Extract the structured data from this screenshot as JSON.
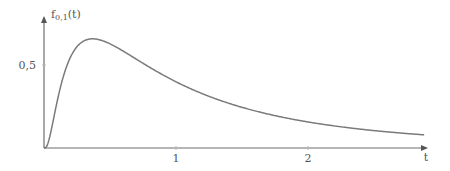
{
  "chart_data": {
    "type": "line",
    "title": "",
    "xlabel": "t",
    "ylabel": "f0,1(t)",
    "ylabel_main": "f",
    "ylabel_sub": "0,1",
    "ylabel_arg": "(t)",
    "x_ticks": [
      {
        "value": 1,
        "label": "1"
      },
      {
        "value": 2,
        "label": "2"
      }
    ],
    "y_ticks": [
      {
        "value": 0.5,
        "label": "0,5"
      }
    ],
    "xlim": [
      0,
      2.9
    ],
    "ylim": [
      0,
      0.8
    ],
    "grid": false,
    "legend": null,
    "series": [
      {
        "name": "f0,1(t) (log-normal density, mu=0, sigma=1)",
        "x": [
          0.0,
          0.05,
          0.1,
          0.15,
          0.2,
          0.25,
          0.3,
          0.37,
          0.45,
          0.5,
          0.6,
          0.7,
          0.8,
          0.9,
          1.0,
          1.2,
          1.4,
          1.6,
          1.8,
          2.0,
          2.2,
          2.4,
          2.6,
          2.88
        ],
        "values": [
          0.0,
          0.092,
          0.282,
          0.446,
          0.547,
          0.607,
          0.644,
          0.658,
          0.645,
          0.627,
          0.583,
          0.536,
          0.49,
          0.447,
          0.399,
          0.327,
          0.268,
          0.22,
          0.181,
          0.157,
          0.13,
          0.111,
          0.095,
          0.077
        ]
      }
    ]
  },
  "axes": {
    "x_label": "t",
    "y_label_f": "f",
    "y_label_sub": "0,1",
    "y_label_arg": "(t)",
    "x_tick_1": "1",
    "x_tick_2": "2",
    "y_tick_05": "0,5"
  }
}
